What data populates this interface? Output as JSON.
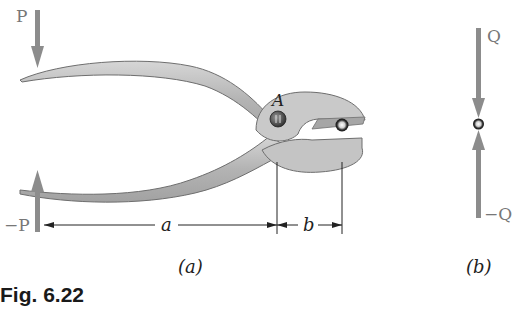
{
  "figure": {
    "caption": "Fig. 6.22",
    "panels": [
      {
        "id": "a",
        "label": "(a)",
        "description": "Pliers with handles squeezed by forces P and -P, pivot A, gripping a small rod",
        "forces": [
          {
            "name": "P",
            "label": "P",
            "direction": "down",
            "location": "upper handle end"
          },
          {
            "name": "-P",
            "label": "−P",
            "direction": "up",
            "location": "lower handle end"
          }
        ],
        "pin_label": "A",
        "dimensions": [
          {
            "label": "a",
            "from": "handle force line",
            "to": "pin A"
          },
          {
            "label": "b",
            "from": "pin A",
            "to": "gripped rod"
          }
        ]
      },
      {
        "id": "b",
        "label": "(b)",
        "description": "Free body of gripped rod",
        "forces": [
          {
            "name": "Q",
            "label": "Q",
            "direction": "down"
          },
          {
            "name": "-Q",
            "label": "−Q",
            "direction": "up"
          }
        ]
      }
    ],
    "colors": {
      "arrow": "#8c8c8c",
      "pliers_fill": "#bdbdbd",
      "pliers_edge": "#6e6e6e",
      "dimension_line": "#222222"
    }
  }
}
